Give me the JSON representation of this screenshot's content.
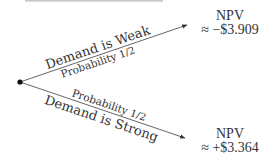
{
  "diagram": {
    "type": "decision-tree",
    "root": {
      "label": ""
    },
    "branches": [
      {
        "event": "Demand is Weak",
        "probability_label": "Probability",
        "probability_value": "1/2",
        "outcome_title": "NPV",
        "outcome_value": "≈ −$3.909"
      },
      {
        "event": "Demand is Strong",
        "probability_label": "Probability",
        "probability_value": "1/2",
        "outcome_title": "NPV",
        "outcome_value": "≈ +$3.364"
      }
    ],
    "colors": {
      "line": "#555555",
      "text": "#333333",
      "node": "#111111"
    }
  }
}
